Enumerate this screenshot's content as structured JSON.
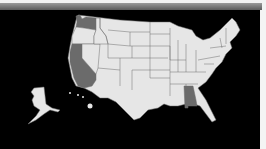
{
  "map": {
    "title": "",
    "background_color": "#000000",
    "default_state_color": "#e6e6e6",
    "highlight_color": "#6b6b6b",
    "border_color": "#6e6e6e",
    "highlighted_states": [
      "Washington",
      "California",
      "Alabama"
    ],
    "regions_shown": [
      "Contiguous United States",
      "Alaska",
      "Hawaii"
    ]
  }
}
